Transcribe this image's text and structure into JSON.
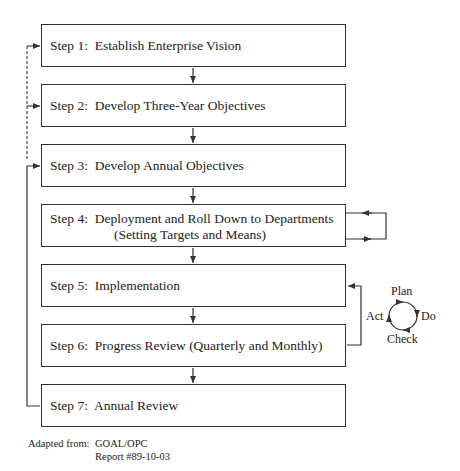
{
  "steps": [
    {
      "label": "Step 1:",
      "text": "Establish Enterprise Vision"
    },
    {
      "label": "Step 2:",
      "text": "Develop Three-Year Objectives"
    },
    {
      "label": "Step 3:",
      "text": "Develop Annual Objectives"
    },
    {
      "label": "Step 4:",
      "text": "Deployment and Roll Down to Departments",
      "text2": "(Setting Targets and Means)"
    },
    {
      "label": "Step 5:",
      "text": "Implementation"
    },
    {
      "label": "Step 6:",
      "text": "Progress Review (Quarterly and Monthly)"
    },
    {
      "label": "Step 7:",
      "text": "Annual Review"
    }
  ],
  "pdca_cycle": {
    "plan": "Plan",
    "do": "Do",
    "check": "Check",
    "act": "Act"
  },
  "caption": {
    "prefix": "Adapted from:",
    "line1": "GOAL/OPC",
    "line2": "Report #89-10-03"
  },
  "colors": {
    "line": "#333333",
    "background": "#ffffff"
  }
}
